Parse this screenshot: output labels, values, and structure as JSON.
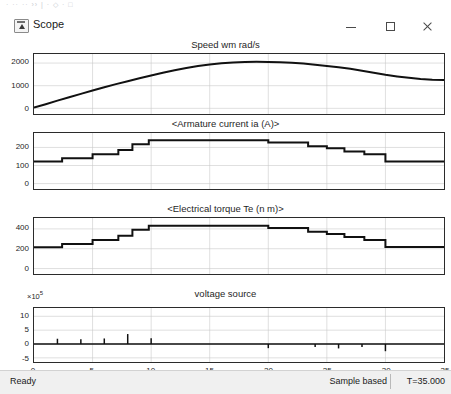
{
  "window": {
    "title": "Scope",
    "icon": "scope-icon",
    "ghost_toolbar_text": "· ··   ·· ›› | · ◇ · □",
    "controls": {
      "minimize": "minimize-button",
      "maximize": "maximize-button",
      "close": "close-button",
      "float_tool": "scope-tool-icon"
    }
  },
  "statusbar": {
    "ready": "Ready",
    "mode": "Sample based",
    "time": "T=35.000"
  },
  "chart_data": [
    {
      "type": "line",
      "title": "Speed wm rad/s",
      "xlabel": "",
      "ylabel": "",
      "xlim": [
        0,
        35
      ],
      "ylim": [
        -250,
        2400
      ],
      "yticks": [
        0,
        1000,
        2000
      ],
      "ytick_labels": [
        "0",
        "1000",
        "2000"
      ],
      "xticks": [
        0,
        5,
        10,
        15,
        20,
        25,
        30,
        35
      ],
      "grid": true,
      "x": [
        0,
        1,
        2,
        3,
        4,
        5,
        6,
        7,
        8,
        9,
        10,
        11,
        12,
        13,
        14,
        15,
        16,
        17,
        18,
        19,
        20,
        21,
        22,
        23,
        24,
        25,
        26,
        27,
        28,
        29,
        30,
        31,
        32,
        33,
        34,
        35
      ],
      "values": [
        30,
        180,
        340,
        490,
        640,
        790,
        930,
        1070,
        1200,
        1330,
        1450,
        1570,
        1680,
        1780,
        1870,
        1940,
        1995,
        2030,
        2050,
        2055,
        2050,
        2035,
        2010,
        1975,
        1930,
        1875,
        1815,
        1745,
        1665,
        1575,
        1480,
        1410,
        1350,
        1300,
        1265,
        1250
      ]
    },
    {
      "type": "line",
      "title": "<Armature current ia (A)>",
      "xlabel": "",
      "ylabel": "",
      "xlim": [
        0,
        35
      ],
      "ylim": [
        -30,
        280
      ],
      "yticks": [
        0,
        100,
        200
      ],
      "ytick_labels": [
        "0",
        "100",
        "200"
      ],
      "xticks": [
        0,
        5,
        10,
        15,
        20,
        25,
        30,
        35
      ],
      "grid": true,
      "step": true,
      "x": [
        0,
        2.4,
        2.4,
        5.0,
        5.0,
        7.2,
        7.2,
        8.4,
        8.4,
        9.8,
        9.8,
        20.0,
        20.0,
        23.4,
        23.4,
        25.0,
        25.0,
        26.5,
        26.5,
        28.2,
        28.2,
        30.0,
        30.0,
        35
      ],
      "values": [
        122,
        122,
        140,
        140,
        162,
        162,
        186,
        186,
        218,
        218,
        240,
        240,
        228,
        228,
        207,
        207,
        196,
        196,
        178,
        178,
        162,
        162,
        122,
        122
      ]
    },
    {
      "type": "line",
      "title": "<Electrical torque Te (n m)>",
      "xlabel": "",
      "ylabel": "",
      "xlim": [
        0,
        35
      ],
      "ylim": [
        -55,
        510
      ],
      "yticks": [
        0,
        200,
        400
      ],
      "ytick_labels": [
        "0",
        "200",
        "400"
      ],
      "xticks": [
        0,
        5,
        10,
        15,
        20,
        25,
        30,
        35
      ],
      "grid": true,
      "step": true,
      "x": [
        0,
        2.4,
        2.4,
        5.0,
        5.0,
        7.2,
        7.2,
        8.4,
        8.4,
        9.8,
        9.8,
        20.0,
        20.0,
        23.4,
        23.4,
        25.0,
        25.0,
        26.5,
        26.5,
        28.2,
        28.2,
        30.0,
        30.0,
        35
      ],
      "values": [
        215,
        215,
        248,
        248,
        288,
        288,
        330,
        330,
        392,
        392,
        432,
        432,
        408,
        408,
        372,
        372,
        348,
        348,
        318,
        318,
        288,
        288,
        218,
        218
      ]
    },
    {
      "type": "line",
      "title": "voltage source",
      "xlabel": "",
      "ylabel": "",
      "exponent": "×10⁵",
      "exponent_base": "×10",
      "exponent_power": "5",
      "xlim": [
        0,
        35
      ],
      "ylim": [
        -6.5,
        13
      ],
      "yticks": [
        -5,
        0,
        5,
        10
      ],
      "ytick_labels": [
        "-5",
        "0",
        "5",
        "10"
      ],
      "xticks": [
        0,
        5,
        10,
        15,
        20,
        25,
        30,
        35
      ],
      "xtick_labels": [
        "0",
        "5",
        "10",
        "15",
        "20",
        "25",
        "30",
        "35"
      ],
      "grid": true,
      "impulses": [
        {
          "x": 2.0,
          "value": 1.9
        },
        {
          "x": 4.0,
          "value": 1.7
        },
        {
          "x": 6.0,
          "value": 2.0
        },
        {
          "x": 8.0,
          "value": 3.6
        },
        {
          "x": 10.0,
          "value": 2.1
        },
        {
          "x": 20.0,
          "value": -1.5
        },
        {
          "x": 24.0,
          "value": -1.1
        },
        {
          "x": 26.0,
          "value": -1.6
        },
        {
          "x": 28.0,
          "value": -1.1
        },
        {
          "x": 30.0,
          "value": -2.6
        }
      ],
      "baseline": 0
    }
  ]
}
